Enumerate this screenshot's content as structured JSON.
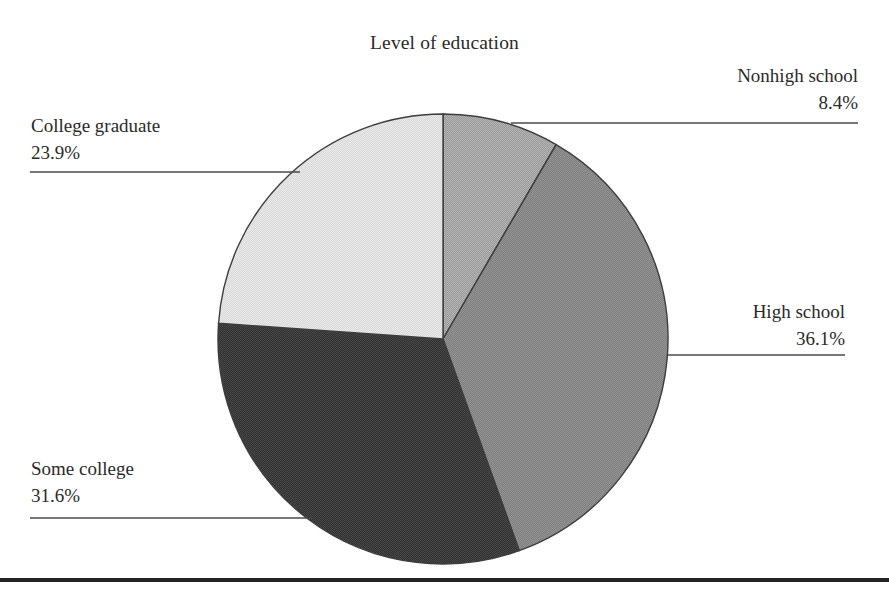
{
  "chart_data": {
    "type": "pie",
    "title": "Level of education",
    "xlabel": "",
    "ylabel": "",
    "legend_position": "callout-labels",
    "grid": false,
    "start_angle_deg": 90,
    "direction": "clockwise",
    "categories": [
      "Nonhigh school",
      "High school",
      "Some college",
      "College graduate"
    ],
    "values": [
      8.4,
      36.1,
      31.6,
      23.9
    ],
    "value_unit": "percent",
    "value_labels": [
      "8.4%",
      "36.1%",
      "31.6%",
      "23.9%"
    ],
    "slices": [
      {
        "label": "Nonhigh school",
        "value": 8.4,
        "value_label": "8.4%",
        "fill": "#9a9a9a",
        "start_angle_deg": 0.0,
        "sweep_angle_deg": 30.2,
        "label_align": "right",
        "leader_line": {
          "x1": 511,
          "y1": 123,
          "x2": 858,
          "y2": 123
        }
      },
      {
        "label": "High school",
        "value": 36.1,
        "value_label": "36.1%",
        "fill": "#7e7e7e",
        "start_angle_deg": 30.2,
        "sweep_angle_deg": 130.0,
        "label_align": "right",
        "leader_line": {
          "x1": 668,
          "y1": 355,
          "x2": 845,
          "y2": 355
        }
      },
      {
        "label": "Some college",
        "value": 31.6,
        "value_label": "31.6%",
        "fill": "#3b3b3b",
        "start_angle_deg": 160.2,
        "sweep_angle_deg": 113.8,
        "label_align": "left",
        "leader_line": {
          "x1": 30,
          "y1": 518,
          "x2": 312,
          "y2": 518
        }
      },
      {
        "label": "College graduate",
        "value": 23.9,
        "value_label": "23.9%",
        "fill": "#d9d9d9",
        "start_angle_deg": 274.0,
        "sweep_angle_deg": 86.0,
        "label_align": "left",
        "leader_line": {
          "x1": 30,
          "y1": 172,
          "x2": 300,
          "y2": 172
        }
      }
    ],
    "geometry": {
      "center_x": 443,
      "center_y": 339,
      "radius": 225
    },
    "colors": {
      "nonhigh_school": "#9a9a9a",
      "high_school": "#7e7e7e",
      "some_college": "#3b3b3b",
      "college_graduate": "#d9d9d9",
      "outline": "#3d3d3d",
      "leader_line": "#4a4a4a",
      "bottom_rule": "#242424",
      "text": "#2a2a2a",
      "background": "#ffffff"
    }
  },
  "callouts": {
    "nonhigh_school": {
      "category": "Nonhigh school",
      "percent": "8.4%"
    },
    "high_school": {
      "category": "High school",
      "percent": "36.1%"
    },
    "some_college": {
      "category": "Some college",
      "percent": "31.6%"
    },
    "college_graduate": {
      "category": "College graduate",
      "percent": "23.9%"
    }
  }
}
